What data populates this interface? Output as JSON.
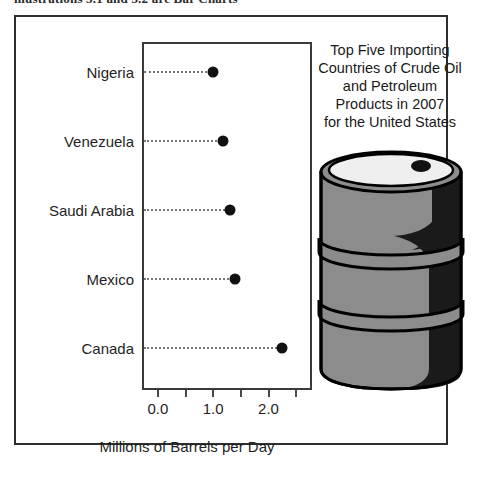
{
  "page": {
    "clipped_header_bold": "mustrations 5.1 and 5.2 are Bar Charts",
    "clipped_header_prefix": "Illustrations 5.1"
  },
  "chart_title_lines": [
    "Top Five Importing",
    "Countries of Crude Oil",
    "and Petroleum",
    "Products in 2007",
    "for the United States"
  ],
  "axis": {
    "x_title": "Millions of Barrels per Day",
    "tick_labels": [
      "0.0",
      "1.0",
      "2.0"
    ]
  },
  "graphic": {
    "name": "oil-barrel-illustration",
    "body_color": "#8c8c8c",
    "shadow_color": "#1a1a1a",
    "outline_color": "#000000"
  },
  "chart_data": {
    "type": "scatter",
    "xlabel": "Millions of Barrels per Day",
    "ylabel": "",
    "categories": [
      "Nigeria",
      "Venezuela",
      "Saudi Arabia",
      "Mexico",
      "Canada"
    ],
    "values": [
      1.0,
      1.18,
      1.3,
      1.4,
      2.25
    ],
    "xlim": [
      -0.25,
      2.75
    ],
    "xticks": [
      0.0,
      0.5,
      1.0,
      1.5,
      2.0,
      2.5
    ],
    "xticklabels": [
      "0.0",
      "",
      "1.0",
      "",
      "2.0",
      ""
    ],
    "grid": false,
    "legend": "none",
    "marker": "filled-circle",
    "marker_color": "#111111",
    "leader_lines": "dotted"
  }
}
